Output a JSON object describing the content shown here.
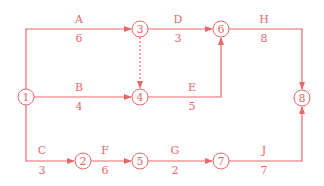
{
  "diagram": {
    "type": "activity-on-arrow network",
    "color": "#e5686c",
    "nodes": [
      {
        "id": "1",
        "label": "1",
        "x": 26,
        "y": 97
      },
      {
        "id": "2",
        "label": "2",
        "x": 83,
        "y": 161
      },
      {
        "id": "3",
        "label": "3",
        "x": 140,
        "y": 29
      },
      {
        "id": "4",
        "label": "4",
        "x": 140,
        "y": 97
      },
      {
        "id": "5",
        "label": "5",
        "x": 140,
        "y": 161
      },
      {
        "id": "6",
        "label": "6",
        "x": 221,
        "y": 29
      },
      {
        "id": "7",
        "label": "7",
        "x": 221,
        "y": 161
      },
      {
        "id": "8",
        "label": "8",
        "x": 302,
        "y": 98
      }
    ],
    "activities": [
      {
        "name": "A",
        "duration": "6",
        "from": "1",
        "to": "3"
      },
      {
        "name": "B",
        "duration": "4",
        "from": "1",
        "to": "4"
      },
      {
        "name": "C",
        "duration": "3",
        "from": "1",
        "to": "2"
      },
      {
        "name": "D",
        "duration": "3",
        "from": "3",
        "to": "6"
      },
      {
        "name": "E",
        "duration": "5",
        "from": "4",
        "to": "6"
      },
      {
        "name": "F",
        "duration": "6",
        "from": "2",
        "to": "5"
      },
      {
        "name": "G",
        "duration": "2",
        "from": "5",
        "to": "7"
      },
      {
        "name": "H",
        "duration": "8",
        "from": "6",
        "to": "8"
      },
      {
        "name": "J",
        "duration": "7",
        "from": "7",
        "to": "8"
      }
    ],
    "dummies": [
      {
        "from": "3",
        "to": "4",
        "style": "dashed"
      }
    ]
  }
}
